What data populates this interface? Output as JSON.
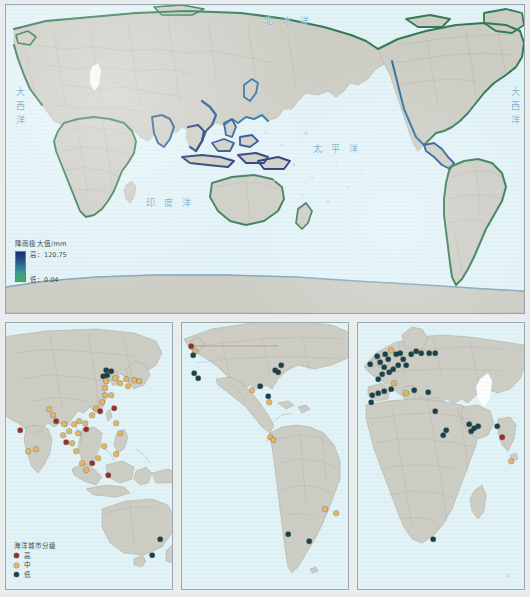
{
  "figure": {
    "background_color": "#e9ecec"
  },
  "main_map": {
    "name": "world-precipitation-map",
    "ocean_color": "#e2f3f8",
    "land_color": "#cdcdc4",
    "coast_color": "#2f7a52",
    "ocean_labels": [
      {
        "text": "北冰洋",
        "x": 258,
        "y": 12,
        "style": "wide"
      },
      {
        "text": "太平洋",
        "x": 307,
        "y": 140,
        "style": "wide"
      },
      {
        "text": "印度洋",
        "x": 140,
        "y": 194,
        "style": "wide"
      },
      {
        "text": "大西洋",
        "x": 11,
        "y": 88,
        "style": "vert"
      },
      {
        "text": "大西洋",
        "x": 506,
        "y": 88,
        "style": "vert"
      }
    ],
    "legend": {
      "title": "降雨极大值/mm",
      "high_label": "高：120.75",
      "low_label": "低：0.04",
      "high_value": 120.75,
      "low_value": 0.04,
      "unit": "mm",
      "ramp_high_color": "#17306e",
      "ramp_low_color": "#4aab5f"
    }
  },
  "sub_maps": [
    {
      "name": "asia-oceania-map",
      "legend": {
        "title": "海洋城市分级",
        "items": [
          {
            "label": "高",
            "color": "#9e2b2b"
          },
          {
            "label": "中",
            "color": "#e8b45a"
          },
          {
            "label": "低",
            "color": "#16424a"
          }
        ]
      },
      "cities": [
        {
          "x": 14,
          "y": 107,
          "class": "high"
        },
        {
          "x": 22,
          "y": 128,
          "class": "mid"
        },
        {
          "x": 43,
          "y": 86,
          "class": "mid"
        },
        {
          "x": 47,
          "y": 92,
          "class": "mid"
        },
        {
          "x": 50,
          "y": 98,
          "class": "high"
        },
        {
          "x": 58,
          "y": 101,
          "class": "mid"
        },
        {
          "x": 57,
          "y": 112,
          "class": "mid"
        },
        {
          "x": 63,
          "y": 108,
          "class": "mid"
        },
        {
          "x": 60,
          "y": 119,
          "class": "high"
        },
        {
          "x": 68,
          "y": 101,
          "class": "mid"
        },
        {
          "x": 73,
          "y": 98,
          "class": "mid"
        },
        {
          "x": 72,
          "y": 110,
          "class": "mid"
        },
        {
          "x": 79,
          "y": 100,
          "class": "mid"
        },
        {
          "x": 80,
          "y": 106,
          "class": "high"
        },
        {
          "x": 86,
          "y": 92,
          "class": "mid"
        },
        {
          "x": 90,
          "y": 85,
          "class": "mid"
        },
        {
          "x": 94,
          "y": 88,
          "class": "high"
        },
        {
          "x": 96,
          "y": 79,
          "class": "mid"
        },
        {
          "x": 99,
          "y": 72,
          "class": "mid"
        },
        {
          "x": 99,
          "y": 65,
          "class": "mid"
        },
        {
          "x": 100,
          "y": 58,
          "class": "mid"
        },
        {
          "x": 97,
          "y": 53,
          "class": "low"
        },
        {
          "x": 101,
          "y": 52,
          "class": "low"
        },
        {
          "x": 100,
          "y": 47,
          "class": "low"
        },
        {
          "x": 105,
          "y": 48,
          "class": "low"
        },
        {
          "x": 109,
          "y": 55,
          "class": "mid"
        },
        {
          "x": 114,
          "y": 60,
          "class": "mid"
        },
        {
          "x": 120,
          "y": 56,
          "class": "mid"
        },
        {
          "x": 122,
          "y": 63,
          "class": "mid"
        },
        {
          "x": 128,
          "y": 57,
          "class": "mid"
        },
        {
          "x": 133,
          "y": 58,
          "class": "mid"
        },
        {
          "x": 105,
          "y": 72,
          "class": "mid"
        },
        {
          "x": 108,
          "y": 85,
          "class": "high"
        },
        {
          "x": 110,
          "y": 100,
          "class": "mid"
        },
        {
          "x": 114,
          "y": 110,
          "class": "mid"
        },
        {
          "x": 98,
          "y": 123,
          "class": "mid"
        },
        {
          "x": 92,
          "y": 135,
          "class": "mid"
        },
        {
          "x": 86,
          "y": 140,
          "class": "high"
        },
        {
          "x": 80,
          "y": 147,
          "class": "mid"
        },
        {
          "x": 76,
          "y": 140,
          "class": "mid"
        },
        {
          "x": 70,
          "y": 128,
          "class": "mid"
        },
        {
          "x": 66,
          "y": 120,
          "class": "mid"
        },
        {
          "x": 30,
          "y": 126,
          "class": "mid"
        },
        {
          "x": 102,
          "y": 152,
          "class": "high"
        },
        {
          "x": 154,
          "y": 216,
          "class": "low"
        },
        {
          "x": 146,
          "y": 232,
          "class": "low"
        },
        {
          "x": 110,
          "y": 131,
          "class": "mid"
        }
      ]
    },
    {
      "name": "americas-map",
      "cities": [
        {
          "x": 9,
          "y": 23,
          "class": "high"
        },
        {
          "x": 13,
          "y": 28,
          "class": "mid"
        },
        {
          "x": 11,
          "y": 32,
          "class": "low"
        },
        {
          "x": 12,
          "y": 50,
          "class": "low"
        },
        {
          "x": 16,
          "y": 55,
          "class": "low"
        },
        {
          "x": 99,
          "y": 42,
          "class": "low"
        },
        {
          "x": 96,
          "y": 49,
          "class": "low"
        },
        {
          "x": 93,
          "y": 47,
          "class": "low"
        },
        {
          "x": 78,
          "y": 63,
          "class": "low"
        },
        {
          "x": 70,
          "y": 67,
          "class": "mid"
        },
        {
          "x": 86,
          "y": 73,
          "class": "low"
        },
        {
          "x": 87,
          "y": 79,
          "class": "mid"
        },
        {
          "x": 88,
          "y": 114,
          "class": "mid"
        },
        {
          "x": 91,
          "y": 117,
          "class": "mid"
        },
        {
          "x": 143,
          "y": 186,
          "class": "mid"
        },
        {
          "x": 154,
          "y": 190,
          "class": "mid"
        },
        {
          "x": 106,
          "y": 211,
          "class": "low"
        },
        {
          "x": 127,
          "y": 218,
          "class": "low"
        }
      ]
    },
    {
      "name": "europe-africa-map",
      "cities": [
        {
          "x": 12,
          "y": 41,
          "class": "low"
        },
        {
          "x": 19,
          "y": 33,
          "class": "low"
        },
        {
          "x": 22,
          "y": 39,
          "class": "low"
        },
        {
          "x": 27,
          "y": 31,
          "class": "low"
        },
        {
          "x": 30,
          "y": 36,
          "class": "low"
        },
        {
          "x": 26,
          "y": 44,
          "class": "low"
        },
        {
          "x": 33,
          "y": 27,
          "class": "mid"
        },
        {
          "x": 38,
          "y": 31,
          "class": "low"
        },
        {
          "x": 42,
          "y": 30,
          "class": "low"
        },
        {
          "x": 45,
          "y": 36,
          "class": "low"
        },
        {
          "x": 40,
          "y": 42,
          "class": "low"
        },
        {
          "x": 35,
          "y": 46,
          "class": "low"
        },
        {
          "x": 31,
          "y": 49,
          "class": "low"
        },
        {
          "x": 24,
          "y": 51,
          "class": "low"
        },
        {
          "x": 20,
          "y": 56,
          "class": "low"
        },
        {
          "x": 48,
          "y": 42,
          "class": "low"
        },
        {
          "x": 53,
          "y": 31,
          "class": "low"
        },
        {
          "x": 58,
          "y": 28,
          "class": "low"
        },
        {
          "x": 63,
          "y": 30,
          "class": "low"
        },
        {
          "x": 71,
          "y": 30,
          "class": "low"
        },
        {
          "x": 77,
          "y": 30,
          "class": "low"
        },
        {
          "x": 36,
          "y": 60,
          "class": "mid"
        },
        {
          "x": 33,
          "y": 66,
          "class": "low"
        },
        {
          "x": 26,
          "y": 68,
          "class": "low"
        },
        {
          "x": 20,
          "y": 70,
          "class": "low"
        },
        {
          "x": 14,
          "y": 72,
          "class": "low"
        },
        {
          "x": 13,
          "y": 79,
          "class": "low"
        },
        {
          "x": 48,
          "y": 70,
          "class": "mid"
        },
        {
          "x": 56,
          "y": 67,
          "class": "low"
        },
        {
          "x": 70,
          "y": 69,
          "class": "low"
        },
        {
          "x": 77,
          "y": 88,
          "class": "low"
        },
        {
          "x": 88,
          "y": 107,
          "class": "low"
        },
        {
          "x": 85,
          "y": 112,
          "class": "low"
        },
        {
          "x": 111,
          "y": 101,
          "class": "low"
        },
        {
          "x": 116,
          "y": 105,
          "class": "low"
        },
        {
          "x": 120,
          "y": 103,
          "class": "low"
        },
        {
          "x": 113,
          "y": 108,
          "class": "low"
        },
        {
          "x": 139,
          "y": 103,
          "class": "low"
        },
        {
          "x": 144,
          "y": 114,
          "class": "high"
        },
        {
          "x": 153,
          "y": 138,
          "class": "mid"
        },
        {
          "x": 75,
          "y": 216,
          "class": "low"
        }
      ]
    }
  ],
  "city_colors": {
    "high": "#9e2b2b",
    "mid": "#e8b45a",
    "low": "#16424a"
  },
  "corner_mark": "©"
}
